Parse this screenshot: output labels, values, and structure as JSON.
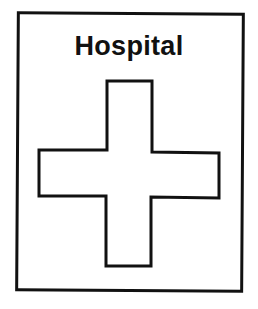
{
  "sign": {
    "title": "Hospital",
    "icon": "cross-icon",
    "colors": {
      "stroke": "#111111",
      "background": "#ffffff"
    }
  }
}
